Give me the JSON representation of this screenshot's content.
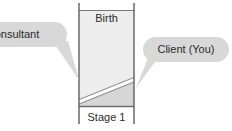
{
  "diagram": {
    "column": {
      "top_label": "Birth",
      "bottom_label": "Stage 1"
    },
    "callouts": [
      {
        "id": "consultant",
        "label": "Consultant",
        "side": "left"
      },
      {
        "id": "client",
        "label": "Client (You)",
        "side": "right"
      }
    ]
  },
  "colors": {
    "column_fill_upper": "#ededed",
    "column_fill_lower": "#d9d9d9",
    "column_stroke": "#6e6e6e",
    "bubble_fill": "#d8d8d8",
    "bubble_stroke": "#cfcfcf",
    "band_fill": "#ffffff",
    "text": "#2b2b2b",
    "background": "#ffffff"
  }
}
